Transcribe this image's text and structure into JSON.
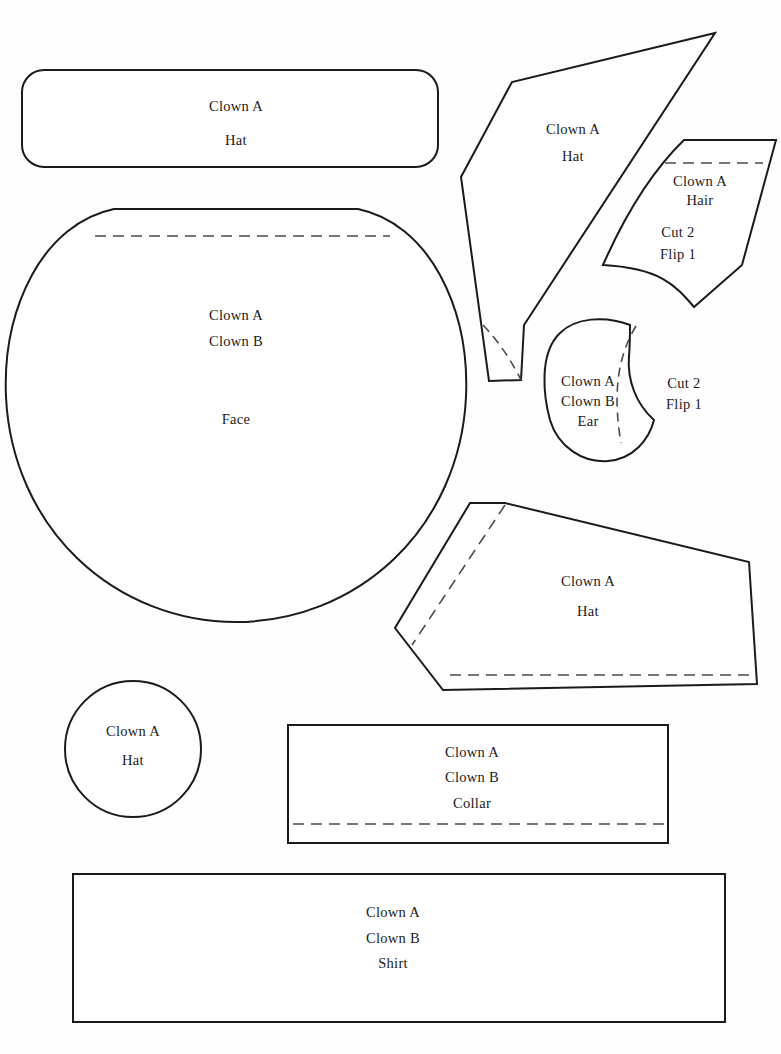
{
  "document": {
    "title": "Clown Costume Pattern Sheet",
    "type": "sewing-pattern-template",
    "page_width": 781,
    "page_height": 1054,
    "background_color": "#fefefe",
    "outline_color": "#1a1a1a",
    "fold_line_color": "#4a4a4a"
  },
  "pieces": [
    {
      "id": "hat-band",
      "shape": "rounded-rectangle",
      "labels": [
        "Clown A",
        "Hat"
      ],
      "label_lines": {
        "line1": "Clown A",
        "line2": "Hat"
      },
      "has_fold_line": false
    },
    {
      "id": "face",
      "shape": "circle-flat-top",
      "labels": [
        "Clown A",
        "Clown B",
        "Face"
      ],
      "label_lines": {
        "line1": "Clown A",
        "line2": "Clown B",
        "line3": "Face"
      },
      "has_fold_line": true
    },
    {
      "id": "hat-cone",
      "shape": "tall-cone-polygon",
      "labels": [
        "Clown A",
        "Hat"
      ],
      "label_lines": {
        "line1": "Clown A",
        "line2": "Hat"
      },
      "has_fold_line": true
    },
    {
      "id": "hair",
      "shape": "curved-quadrilateral",
      "labels": [
        "Clown A",
        "Hair",
        "Cut 2",
        "Flip 1"
      ],
      "label_lines": {
        "line1": "Clown A",
        "line2": "Hair",
        "line3": "Cut 2",
        "line4": "Flip 1"
      },
      "has_fold_line": true
    },
    {
      "id": "ear",
      "shape": "crescent",
      "labels": [
        "Clown A",
        "Clown B",
        "Ear",
        "Cut 2",
        "Flip 1"
      ],
      "label_lines": {
        "line1": "Clown A",
        "line2": "Clown B",
        "line3": "Ear"
      },
      "note_lines": {
        "line1": "Cut 2",
        "line2": "Flip 1"
      },
      "has_fold_line": true
    },
    {
      "id": "hat-brim",
      "shape": "irregular-polygon",
      "labels": [
        "Clown A",
        "Hat"
      ],
      "label_lines": {
        "line1": "Clown A",
        "line2": "Hat"
      },
      "has_fold_line": true
    },
    {
      "id": "hat-top-circle",
      "shape": "circle",
      "labels": [
        "Clown A",
        "Hat"
      ],
      "label_lines": {
        "line1": "Clown A",
        "line2": "Hat"
      },
      "has_fold_line": false
    },
    {
      "id": "collar",
      "shape": "rectangle",
      "labels": [
        "Clown A",
        "Clown B",
        "Collar"
      ],
      "label_lines": {
        "line1": "Clown A",
        "line2": "Clown B",
        "line3": "Collar"
      },
      "has_fold_line": true
    },
    {
      "id": "shirt",
      "shape": "rectangle",
      "labels": [
        "Clown A",
        "Clown B",
        "Shirt"
      ],
      "label_lines": {
        "line1": "Clown A",
        "line2": "Clown B",
        "line3": "Shirt"
      },
      "has_fold_line": false
    }
  ]
}
